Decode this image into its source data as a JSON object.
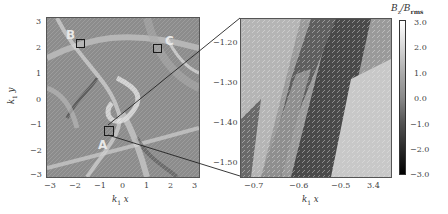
{
  "figure": {
    "left_panel": {
      "xlabel": "k",
      "xlabel_sub": "1",
      "xlabel_var": "x",
      "ylabel": "k",
      "ylabel_sub": "1",
      "ylabel_var": "y",
      "xticks": [
        "−3",
        "−2",
        "−1",
        "0",
        "1",
        "2",
        "3"
      ],
      "yticks": [
        "3",
        "2",
        "1",
        "0",
        "−1",
        "−2",
        "−3"
      ],
      "regions": [
        {
          "label": "A"
        },
        {
          "label": "B"
        },
        {
          "label": "C"
        }
      ]
    },
    "right_panel": {
      "xlabel": "k",
      "xlabel_sub": "1",
      "xlabel_var": "x",
      "xticks": [
        "−0.7",
        "−0.6",
        "−0.5",
        "3.4"
      ],
      "yticks": [
        "−1.20",
        "−1.30",
        "−1.40",
        "−1.50"
      ]
    },
    "colorbar": {
      "label_num": "B",
      "label_num_sub": "z",
      "label_den": "B",
      "label_den_sub": "rms",
      "ticks": [
        "3.0",
        "2.0",
        "1.0",
        "0.0",
        "−1.0",
        "−2.0",
        "−3.0"
      ]
    }
  }
}
